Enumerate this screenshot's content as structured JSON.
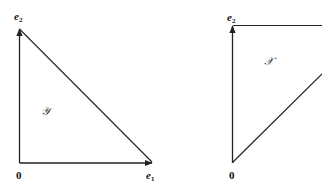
{
  "figure": {
    "left_panel": {
      "region_label": "𝒴",
      "origin_label": "0",
      "e1": {
        "base": "e",
        "sub": "1"
      },
      "e2": {
        "base": "e",
        "sub": "2"
      },
      "shape": "right triangle with vertices 0, e1, e2; arrows along 0→e1 and 0→e2; hypotenuse e2–e1"
    },
    "right_panel": {
      "region_label": "𝒳",
      "origin_label": "0",
      "e2": {
        "base": "e",
        "sub": "2"
      },
      "shape": "unbounded wedge: arrow 0→e2, horizontal ray from e2 to the right, diagonal ray from 0 up-right"
    },
    "colors": {
      "line": "#222222",
      "background": "#ffffff"
    }
  }
}
